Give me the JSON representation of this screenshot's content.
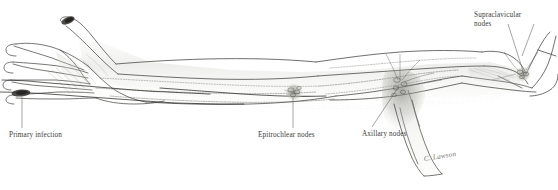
{
  "figure": {
    "background_color": "#ffffff",
    "ink_color": "#3a3a38",
    "shade_color": "#b9b9b4",
    "lesion_color": "#3d3b38",
    "width": 558,
    "height": 190
  },
  "labels": {
    "primary_infection": "Primary infection",
    "epitrochlear_nodes": "Epitrochlear nodes",
    "axillary_nodes": "Axillary nodes",
    "supraclavicular_line1": "Supraclavicular",
    "supraclavicular_line2": "nodes"
  },
  "signature": {
    "text": "C. Lawson"
  },
  "leader_lines": [
    {
      "name": "primary-infection-leader",
      "from": [
        22,
        97
      ],
      "to": [
        22,
        128
      ]
    },
    {
      "name": "epitrochlear-leader",
      "from": [
        293,
        96
      ],
      "to": [
        293,
        128
      ]
    },
    {
      "name": "axillary-leader",
      "from": [
        399,
        86
      ],
      "to": [
        372,
        127
      ]
    },
    {
      "name": "supraclavicular-leader",
      "from": [
        508,
        24
      ],
      "to": [
        524,
        76
      ]
    }
  ],
  "anatomy_parts": [
    {
      "name": "hand",
      "note": "open palm, fingers spread, left side of image"
    },
    {
      "name": "thumb",
      "note": "extends upward-left with dark lesion at tip"
    },
    {
      "name": "forearm",
      "note": "runs left to right toward elbow"
    },
    {
      "name": "elbow",
      "note": "epitrochlear node cluster at mid image"
    },
    {
      "name": "upper-arm",
      "note": "runs toward axilla"
    },
    {
      "name": "axilla",
      "note": "dense shaded axillary node cluster"
    },
    {
      "name": "shoulder",
      "note": "right end of arm"
    },
    {
      "name": "clavicle-neck",
      "note": "far right, supraclavicular nodes"
    },
    {
      "name": "lymphatic-vessels",
      "note": "beaded lines tracking along limb"
    }
  ]
}
